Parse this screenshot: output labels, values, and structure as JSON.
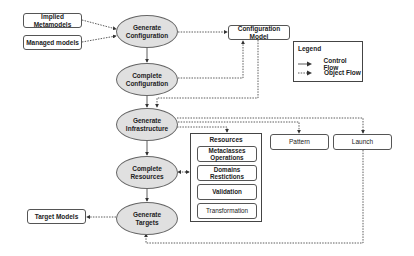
{
  "nodes": {
    "implied_metamodels": "Implied Metamodels",
    "managed_models": "Managed models",
    "generate_configuration": "Generate\nConfiguration",
    "configuration_model": "Configuration Model",
    "complete_configuration": "Complete\nConfiguration",
    "generate_infrastructure": "Generate\nInfrastructure",
    "complete_resources": "Complete\nResources",
    "generate_targets": "Generate\nTargets",
    "target_models": "Target Models",
    "pattern": "Pattern",
    "launch": "Launch"
  },
  "resources": {
    "title": "Resources",
    "items": [
      "Metaclasses\nOperations",
      "Domains\nRestictions",
      "Validation",
      "Transformation"
    ]
  },
  "legend": {
    "title": "Legend",
    "control_flow": "Control Flow",
    "object_flow": "Object Flow"
  },
  "colors": {
    "ellipse_fill": "#e0e0e0",
    "stroke": "#444444"
  }
}
